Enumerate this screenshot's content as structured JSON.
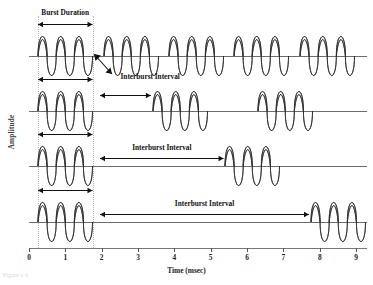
{
  "figure": {
    "title_visible": false,
    "caption_stub": "Figure 1-1",
    "background_color": "#ffffff",
    "wave_stroke_color": "#2b2b2b",
    "wave_fill_light": "#f2f2f2",
    "wave_fill_dark": "#4a4a4a",
    "baseline_color": "#6d6d6d",
    "guide_color": "#b9b9b9"
  },
  "axes": {
    "y_label": "Amplitude",
    "x_label": "Time (msec)",
    "x_ticks": [
      "0",
      "1",
      "2",
      "3",
      "4",
      "5",
      "6",
      "7",
      "8",
      "9"
    ],
    "x_min": 0,
    "x_max": 9.3
  },
  "annotations": {
    "burst_duration_label": "Burst Duration",
    "interburst_label_row1": "Interburst Interval",
    "interburst_label_row2": "Interburst Interval",
    "interburst_label_row3": "Interburst Interval",
    "interburst_label_row4": "Interburst Interval"
  },
  "chart_data": {
    "type": "line",
    "title": "",
    "xlabel": "Time (msec)",
    "ylabel": "Amplitude",
    "xlim": [
      0,
      9.3
    ],
    "ylim": [
      -1,
      1
    ],
    "grid": false,
    "legend": "none",
    "burst_duration_msec": 1.5,
    "cycles_per_burst": 3,
    "guides_msec": [
      0.25,
      1.75
    ],
    "series": [
      {
        "name": "Row 1 - shortest interburst interval",
        "interburst_interval_msec": 0.5,
        "burst_starts_msec": [
          0.25,
          2.05,
          3.85,
          5.65,
          7.45
        ],
        "burst_count": 5
      },
      {
        "name": "Row 2 - short interburst interval",
        "interburst_interval_msec": 1.75,
        "burst_starts_msec": [
          0.25,
          3.4,
          6.3
        ],
        "burst_count": 3
      },
      {
        "name": "Row 3 - medium interburst interval",
        "interburst_interval_msec": 3.6,
        "burst_starts_msec": [
          0.25,
          5.4
        ],
        "burst_count": 2
      },
      {
        "name": "Row 4 - longest interburst interval",
        "interburst_interval_msec": 6.0,
        "burst_starts_msec": [
          0.25,
          7.75
        ],
        "burst_count": 2
      }
    ],
    "measure_arrows": [
      {
        "label": "Burst Duration",
        "row": 1,
        "from_msec": 0.25,
        "to_msec": 1.75
      },
      {
        "label": "Burst Duration",
        "row": 2,
        "from_msec": 0.25,
        "to_msec": 1.75
      },
      {
        "label": "Burst Duration",
        "row": 3,
        "from_msec": 0.25,
        "to_msec": 1.75
      },
      {
        "label": "Burst Duration",
        "row": 4,
        "from_msec": 0.25,
        "to_msec": 1.75
      },
      {
        "label": "Interburst Interval",
        "row": 1,
        "from_msec": 1.78,
        "to_msec": 2.05
      },
      {
        "label": "Interburst Interval",
        "row": 2,
        "from_msec": 1.95,
        "to_msec": 3.35
      },
      {
        "label": "Interburst Interval",
        "row": 3,
        "from_msec": 1.95,
        "to_msec": 5.35
      },
      {
        "label": "Interburst Interval",
        "row": 4,
        "from_msec": 1.95,
        "to_msec": 7.7
      }
    ]
  }
}
